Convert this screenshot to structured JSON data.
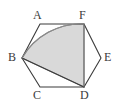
{
  "figure": {
    "kind": "geometry-diagram",
    "canvas": {
      "width": 123,
      "height": 104
    },
    "background_color": "#ffffff",
    "stroke_color": "#3b3b3b",
    "stroke_width": 1.1,
    "shade_fill_color": "#d9d9d9",
    "shade_stroke_color": "#8a8a8a",
    "label_color": "#3b3b3b",
    "label_font_size": 12,
    "hexagon": {
      "name": "hexagon-outline",
      "closed": true,
      "vertices": [
        {
          "id": "A",
          "label": "A",
          "x": 40,
          "y": 24,
          "label_x": 33,
          "label_y": 9
        },
        {
          "id": "F",
          "label": "F",
          "x": 84,
          "y": 24,
          "label_x": 79,
          "label_y": 9
        },
        {
          "id": "E",
          "label": "E",
          "x": 101,
          "y": 58,
          "label_x": 104,
          "label_y": 51
        },
        {
          "id": "D",
          "label": "D",
          "x": 84,
          "y": 87,
          "label_x": 80,
          "label_y": 89
        },
        {
          "id": "C",
          "label": "C",
          "x": 40,
          "y": 87,
          "label_x": 33,
          "label_y": 89
        },
        {
          "id": "B",
          "label": "B",
          "x": 22,
          "y": 58,
          "label_x": 8,
          "label_y": 51
        }
      ]
    },
    "shaded_region": {
      "name": "shaded-sector",
      "path": "M 22 58 A 68 68 0 0 1 84 24 L 84 87 Z",
      "arc": {
        "from": "B",
        "to": "F",
        "center": "D",
        "radius": 68,
        "sweep": "clockwise"
      },
      "edges": [
        {
          "from": "F",
          "to": "D"
        },
        {
          "from": "D",
          "to": "B"
        }
      ]
    },
    "chords": [
      {
        "name": "chord-D-B",
        "from": "D",
        "to": "B"
      },
      {
        "name": "chord-F-D",
        "from": "F",
        "to": "D"
      }
    ]
  }
}
